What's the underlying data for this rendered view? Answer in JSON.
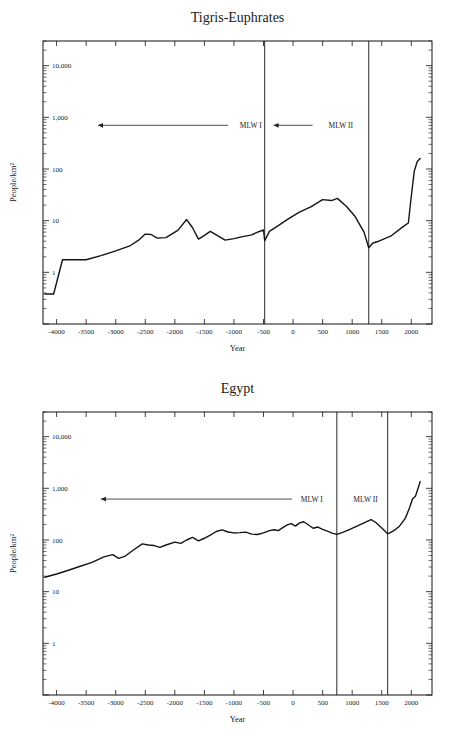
{
  "page": {
    "background": "#ffffff",
    "line_color": "#141414",
    "axis_color": "#111111"
  },
  "charts": [
    {
      "id": "tigris-euphrates",
      "title": "Tigris-Euphrates",
      "xlabel": "Year",
      "ylabel": "People/km²",
      "y_ticks": [
        "10,000",
        "1,000",
        "100",
        "10",
        "1"
      ],
      "x_ticks": [
        "-4000",
        "-3500",
        "-3000",
        "-2500",
        "-2000",
        "-1500",
        "-1000",
        "-500",
        "0",
        "500",
        "1000",
        "1500",
        "2000"
      ],
      "annotations": [
        {
          "label": "MLW I",
          "arrow": "left"
        },
        {
          "label": "MLW II",
          "arrow": "left"
        }
      ]
    },
    {
      "id": "egypt",
      "title": "Egypt",
      "xlabel": "Year",
      "ylabel": "People/km²",
      "y_ticks": [
        "10,000",
        "1,000",
        "100",
        "10",
        "1"
      ],
      "x_ticks": [
        "-4000",
        "-3500",
        "-3000",
        "-2500",
        "-2000",
        "-1500",
        "-1000",
        "-500",
        "0",
        "500",
        "1000",
        "1500",
        "2000"
      ],
      "annotations": [
        {
          "label": "MLW I",
          "arrow": "left"
        },
        {
          "label": "MLW II",
          "arrow": "left"
        }
      ]
    }
  ],
  "chart_data": [
    {
      "type": "line",
      "title": "Tigris-Euphrates",
      "xlabel": "Year",
      "ylabel": "People/km²",
      "yscale": "log",
      "ylim": [
        0.1,
        30000
      ],
      "xlim": [
        -4230,
        2350
      ],
      "grid": false,
      "legend": "none",
      "y_tick_values": [
        1,
        10,
        100,
        1000,
        10000
      ],
      "y_tick_labels": [
        "1",
        "10",
        "100",
        "1,000",
        "10,000"
      ],
      "x_tick_values": [
        -4000,
        -3500,
        -3000,
        -2500,
        -2000,
        -1500,
        -1000,
        -500,
        0,
        500,
        1000,
        1500,
        2000
      ],
      "annotations": [
        {
          "text": "MLW I",
          "x": -900,
          "y": 700,
          "arrow_from": -1100,
          "arrow_to": -3300
        },
        {
          "text": "MLW II",
          "x": 600,
          "y": 700,
          "arrow_from": 330,
          "arrow_to": -330
        }
      ],
      "vlines": [
        -480,
        1280
      ],
      "series": [
        {
          "name": "Tigris-Euphrates population density",
          "x": [
            -4200,
            -4050,
            -3900,
            -3750,
            -3500,
            -3250,
            -3000,
            -2750,
            -2600,
            -2500,
            -2400,
            -2300,
            -2150,
            -1950,
            -1800,
            -1700,
            -1600,
            -1500,
            -1400,
            -1300,
            -1150,
            -1000,
            -850,
            -700,
            -600,
            -500,
            -480,
            -400,
            -250,
            -100,
            100,
            300,
            500,
            650,
            750,
            900,
            1050,
            1200,
            1280,
            1350,
            1450,
            1650,
            1850,
            1950,
            2000,
            2050,
            2100,
            2150
          ],
          "y": [
            0.38,
            0.38,
            1.75,
            1.75,
            1.75,
            2.1,
            2.6,
            3.3,
            4.3,
            5.5,
            5.4,
            4.6,
            4.7,
            6.5,
            10.5,
            7.3,
            4.4,
            5.2,
            6.2,
            5.3,
            4.2,
            4.5,
            4.9,
            5.3,
            6.0,
            6.6,
            4.1,
            6.2,
            8.0,
            10.5,
            14.5,
            18.5,
            25.5,
            24.5,
            27.0,
            19.0,
            12.0,
            6.0,
            3.0,
            3.7,
            4.0,
            5.0,
            7.5,
            9.0,
            30.0,
            90.0,
            140.0,
            160.0
          ]
        }
      ]
    },
    {
      "type": "line",
      "title": "Egypt",
      "xlabel": "Year",
      "ylabel": "People/km²",
      "yscale": "log",
      "ylim": [
        0.1,
        30000
      ],
      "xlim": [
        -4230,
        2350
      ],
      "grid": false,
      "legend": "none",
      "y_tick_values": [
        1,
        10,
        100,
        1000,
        10000
      ],
      "y_tick_labels": [
        "1",
        "10",
        "100",
        "1,000",
        "10,000"
      ],
      "x_tick_values": [
        -4000,
        -3500,
        -3000,
        -2500,
        -2000,
        -1500,
        -1000,
        -500,
        0,
        500,
        1000,
        1500,
        2000
      ],
      "annotations": [
        {
          "text": "MLW I",
          "x": 130,
          "y": 620,
          "arrow_from": -20,
          "arrow_to": -3250
        },
        {
          "text": "MLW II",
          "x": 1020,
          "y": 620,
          "arrow_from": null,
          "arrow_to": null
        }
      ],
      "vlines": [
        740,
        1600
      ],
      "series": [
        {
          "name": "Egypt population density",
          "x": [
            -4200,
            -4000,
            -3800,
            -3600,
            -3400,
            -3200,
            -3050,
            -2950,
            -2850,
            -2700,
            -2550,
            -2450,
            -2350,
            -2250,
            -2150,
            -2000,
            -1900,
            -1800,
            -1700,
            -1600,
            -1500,
            -1400,
            -1300,
            -1200,
            -1100,
            -1000,
            -900,
            -800,
            -700,
            -600,
            -500,
            -400,
            -320,
            -250,
            -180,
            -100,
            -30,
            40,
            110,
            180,
            260,
            340,
            420,
            500,
            580,
            660,
            740,
            840,
            960,
            1080,
            1200,
            1320,
            1400,
            1500,
            1600,
            1700,
            1800,
            1900,
            1970,
            2020,
            2070,
            2120,
            2150
          ],
          "y": [
            19.0,
            22.0,
            26.0,
            31.0,
            37.0,
            47.0,
            52.0,
            44.0,
            48.0,
            64.0,
            84.0,
            80.0,
            78.0,
            72.0,
            80.0,
            91.0,
            86.0,
            100.0,
            112.0,
            96.0,
            108.0,
            124.0,
            146.0,
            157.0,
            143.0,
            137.0,
            139.0,
            142.0,
            130.0,
            128.0,
            137.0,
            152.0,
            158.0,
            152.0,
            172.0,
            196.0,
            208.0,
            186.0,
            214.0,
            225.0,
            195.0,
            169.0,
            178.0,
            160.0,
            148.0,
            136.0,
            128.0,
            140.0,
            160.0,
            185.0,
            215.0,
            248.0,
            218.0,
            170.0,
            132.0,
            150.0,
            185.0,
            265.0,
            420.0,
            620.0,
            700.0,
            1050.0,
            1350.0
          ]
        }
      ]
    }
  ]
}
